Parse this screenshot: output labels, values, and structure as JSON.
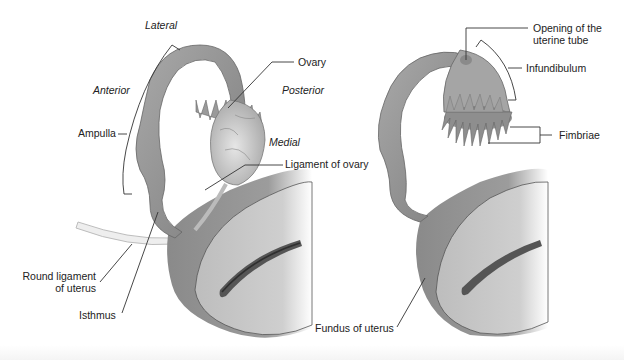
{
  "figure": {
    "left_panel": {
      "name": "uterine tube with ovary",
      "orientation_labels": {
        "lateral": "Lateral",
        "anterior": "Anterior",
        "posterior": "Posterior",
        "medial": "Medial"
      },
      "labels": {
        "ovary": "Ovary",
        "ampulla": "Ampulla",
        "ligament_of_ovary": "Ligament of ovary",
        "round_ligament_line1": "Round ligament",
        "round_ligament_line2": "of uterus",
        "isthmus": "Isthmus"
      }
    },
    "right_panel": {
      "name": "uterine tube without ovary",
      "labels": {
        "opening_line1": "Opening of the",
        "opening_line2": "uterine tube",
        "infundibulum": "Infundibulum",
        "fimbriae": "Fimbriae",
        "fundus": "Fundus of uterus"
      }
    },
    "colors": {
      "tissue": "#8e8e8e",
      "tissue_light": "#b5b5b5",
      "uterus_cut": "#c9c9c9",
      "leader_line": "#333333",
      "text": "#222222"
    }
  }
}
